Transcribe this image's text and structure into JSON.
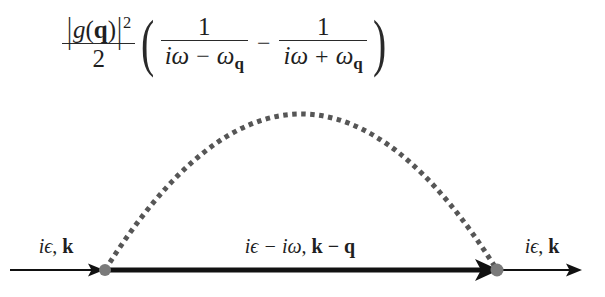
{
  "figure": {
    "kind": "feynman-diagram",
    "background_color": "#ffffff",
    "line_color": "#111111",
    "phonon_color": "#565656",
    "vertex_color": "#777777"
  },
  "formula": {
    "prefactor": {
      "numerator": {
        "bar_open": "|",
        "g": "g",
        "paren_open": "(",
        "q": "q",
        "paren_close": ")",
        "bar_close": "|",
        "exponent": "2"
      },
      "denominator": "2"
    },
    "paren_open": "(",
    "paren_close": ")",
    "operator": "−",
    "term1": {
      "numerator": "1",
      "denominator": {
        "i": "i",
        "omega": "ω",
        "sign": "−",
        "omega_sub": "ω",
        "subscript": "q"
      }
    },
    "term2": {
      "numerator": "1",
      "denominator": {
        "i": "i",
        "omega": "ω",
        "sign": "+",
        "omega_sub": "ω",
        "subscript": "q"
      }
    }
  },
  "labels": {
    "incoming": {
      "epsilon": "iϵ",
      "comma": ",",
      "momentum": "k"
    },
    "internal": {
      "epsilon": "iϵ − iω",
      "comma": ",",
      "momentum": "k − q"
    },
    "outgoing": {
      "epsilon": "iϵ",
      "comma": ",",
      "momentum": "k"
    }
  },
  "geometry": {
    "left_vertex_x": 105,
    "right_vertex_x": 497,
    "baseline_y": 270,
    "arc_apex_y": 113,
    "incoming_line_start_x": 10,
    "outgoing_line_end_x": 582
  }
}
